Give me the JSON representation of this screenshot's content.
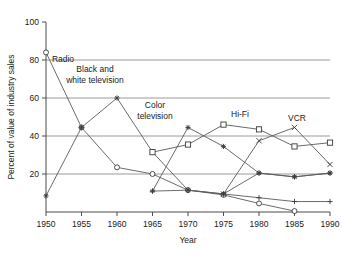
{
  "chart_data": {
    "type": "line",
    "title": "",
    "xlabel": "Year",
    "ylabel": "Percent of value of industry sales",
    "x": [
      1950,
      1955,
      1960,
      1965,
      1970,
      1975,
      1980,
      1985,
      1990
    ],
    "xlim": [
      1950,
      1990
    ],
    "ylim": [
      0,
      100
    ],
    "xticks": [
      "1950",
      "1955",
      "1960",
      "1965",
      "1970",
      "1975",
      "1980",
      "1985",
      "1990"
    ],
    "yticks": [
      "20",
      "40",
      "60",
      "80",
      "100"
    ],
    "grid": "horizontal-only",
    "legend": "inline-annotations",
    "series": [
      {
        "name": "Radio",
        "marker": "open-circle",
        "x": [
          1950,
          1955,
          1960,
          1965,
          1970,
          1975,
          1980,
          1985
        ],
        "values": [
          84,
          44.5,
          23.5,
          20,
          11.5,
          9,
          4.5,
          0.5
        ]
      },
      {
        "name": "Black and white television",
        "marker": "asterisk",
        "x": [
          1950,
          1955,
          1960,
          1965,
          1970,
          1975,
          1980,
          1985,
          1990
        ],
        "values": [
          8.5,
          44.5,
          60,
          31.5,
          11.5,
          9.5,
          20.5,
          18.5,
          20.5
        ]
      },
      {
        "name": "Color television",
        "marker": "asterisk",
        "x": [
          1965,
          1970,
          1975,
          1980,
          1985,
          1990
        ],
        "values": [
          11,
          44.5,
          34.5,
          20.5,
          18.5,
          20.5
        ]
      },
      {
        "name": "Hi-Fi",
        "marker": "open-square",
        "x": [
          1965,
          1970,
          1975,
          1980,
          1985,
          1990
        ],
        "values": [
          31.5,
          35.5,
          46,
          43.5,
          34.5,
          36.5
        ]
      },
      {
        "name": "VCR",
        "marker": "cross",
        "x": [
          1975,
          1980,
          1985,
          1990
        ],
        "values": [
          9.5,
          37.5,
          44.5,
          25
        ]
      },
      {
        "name": "declining-plus-series",
        "marker": "plus",
        "x": [
          1965,
          1970,
          1975,
          1980,
          1985,
          1990
        ],
        "values": [
          11,
          11.5,
          9.5,
          7.5,
          5.5,
          5.5
        ]
      }
    ],
    "annotations": [
      {
        "label": "Radio",
        "x_px": 63,
        "y_px": 62,
        "lines": [
          "Radio"
        ]
      },
      {
        "label": "Black and white television",
        "x_px": 95,
        "y_px": 72,
        "lines": [
          "Black and",
          "white television"
        ]
      },
      {
        "label": "Color television",
        "x_px": 155,
        "y_px": 108,
        "lines": [
          "Color",
          "television"
        ]
      },
      {
        "label": "Hi-Fi",
        "x_px": 240,
        "y_px": 117,
        "lines": [
          "Hi-Fi"
        ]
      },
      {
        "label": "VCR",
        "x_px": 297,
        "y_px": 121,
        "lines": [
          "VCR"
        ]
      }
    ]
  }
}
